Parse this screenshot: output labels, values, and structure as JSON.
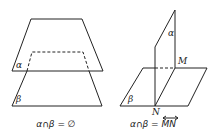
{
  "left_figure": {
    "plane_top_label": "α",
    "plane_bottom_label": "β",
    "equation": "α∩β = ∅"
  },
  "right_figure": {
    "plane_vertical_label": "α",
    "plane_horizontal_label": "β",
    "point_top_label": "M",
    "point_bottom_label": "N",
    "equation_prefix": "α∩β = ",
    "equation_line": "MN"
  }
}
